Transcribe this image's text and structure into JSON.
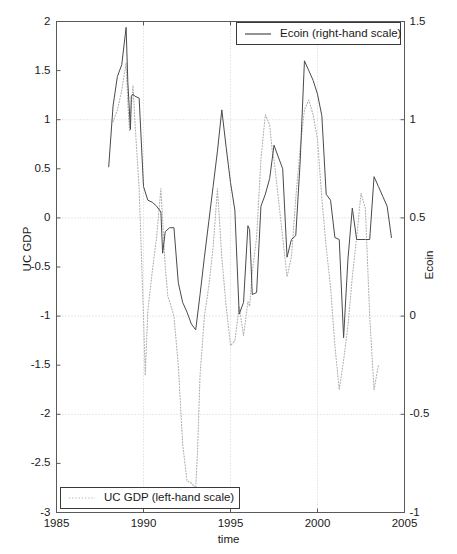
{
  "chart_data": {
    "type": "line",
    "title": "",
    "xlabel": "time",
    "ylabel": "UC GDP",
    "ylabel_right": "Ecoin",
    "grid": true,
    "xlim": [
      1985,
      2005
    ],
    "ylim_left": [
      -3,
      2
    ],
    "ylim_right": [
      -1,
      1.5
    ],
    "xticks": [
      1985,
      1990,
      1995,
      2000,
      2005
    ],
    "xticklabels": [
      "1985",
      "1990",
      "1995",
      "2000",
      "2005"
    ],
    "yticks_left": [
      2,
      1.5,
      1,
      0.5,
      0,
      -0.5,
      -1,
      -1.5,
      -2,
      -2.5,
      -3
    ],
    "yticklabels_left": [
      "2",
      "1.5",
      "1",
      "0.5",
      "0",
      "-0.5",
      "-1",
      "-1.5",
      "-2",
      "-2.5",
      "-3"
    ],
    "yticks_right": [
      1.5,
      1,
      0.5,
      0,
      -0.5,
      -1
    ],
    "yticklabels_right": [
      "1.5",
      "1",
      "0.5",
      "0",
      "-0.5",
      "-1"
    ],
    "legend_position": [
      "upper right",
      "lower left"
    ],
    "series": [
      {
        "name": "Ecoin (right-hand scale)",
        "axis": "right",
        "style": "solid",
        "color": "#4a4a4a",
        "x": [
          1988.0,
          1988.25,
          1988.5,
          1988.75,
          1989.0,
          1989.1,
          1989.25,
          1989.3,
          1989.4,
          1989.5,
          1989.75,
          1990.0,
          1990.25,
          1990.5,
          1990.75,
          1991.0,
          1991.1,
          1991.25,
          1991.5,
          1991.75,
          1992.0,
          1992.25,
          1992.5,
          1992.75,
          1993.0,
          1993.25,
          1993.5,
          1993.75,
          1994.0,
          1994.25,
          1994.5,
          1994.75,
          1995.0,
          1995.25,
          1995.5,
          1995.75,
          1996.0,
          1996.1,
          1996.25,
          1996.5,
          1996.75,
          1997.0,
          1997.25,
          1997.5,
          1997.75,
          1998.0,
          1998.25,
          1998.5,
          1998.75,
          1999.0,
          1999.25,
          1999.5,
          1999.75,
          2000.0,
          2000.25,
          2000.5,
          2000.75,
          2001.0,
          2001.25,
          2001.5,
          2001.75,
          2002.0,
          2002.25,
          2002.5,
          2002.75,
          2003.0,
          2003.25,
          2003.5,
          2003.75,
          2004.0,
          2004.25
        ],
        "y": [
          0.76,
          1.07,
          1.22,
          1.28,
          1.47,
          1.19,
          0.95,
          1.12,
          1.13,
          1.12,
          1.11,
          0.66,
          0.59,
          0.58,
          0.56,
          0.53,
          0.32,
          0.43,
          0.45,
          0.45,
          0.17,
          0.07,
          0.02,
          -0.04,
          -0.07,
          0.11,
          0.3,
          0.48,
          0.66,
          0.84,
          1.05,
          0.86,
          0.68,
          0.54,
          0.01,
          0.07,
          0.46,
          0.44,
          0.11,
          0.12,
          0.56,
          0.62,
          0.7,
          0.87,
          0.81,
          0.75,
          0.3,
          0.39,
          0.41,
          0.78,
          1.3,
          1.25,
          1.2,
          1.13,
          1.02,
          0.62,
          0.59,
          0.4,
          0.39,
          -0.11,
          0.29,
          0.55,
          0.39,
          0.39,
          0.39,
          0.39,
          0.71,
          0.66,
          0.61,
          0.56,
          0.4
        ]
      },
      {
        "name": "UC GDP (left-hand scale)",
        "axis": "left",
        "style": "dotted",
        "color": "#b0b0b0",
        "x": [
          1988.25,
          1988.5,
          1988.75,
          1989.0,
          1989.1,
          1989.2,
          1989.25,
          1989.4,
          1989.5,
          1989.75,
          1990.0,
          1990.1,
          1990.25,
          1990.5,
          1990.75,
          1991.0,
          1991.25,
          1991.4,
          1991.5,
          1991.75,
          1992.0,
          1992.25,
          1992.5,
          1992.75,
          1993.0,
          1993.1,
          1993.25,
          1993.5,
          1993.75,
          1994.0,
          1994.25,
          1994.5,
          1994.75,
          1995.0,
          1995.25,
          1995.4,
          1995.5,
          1995.75,
          1996.0,
          1996.1,
          1996.25,
          1996.5,
          1996.75,
          1997.0,
          1997.25,
          1997.4,
          1997.5,
          1997.75,
          1998.0,
          1998.25,
          1998.5,
          1998.75,
          1999.0,
          1999.25,
          1999.5,
          1999.75,
          2000.0,
          2000.25,
          2000.5,
          2000.75,
          2001.0,
          2001.25,
          2001.5,
          2001.75,
          2002.0,
          2002.25,
          2002.5,
          2002.75,
          2003.0,
          2003.25,
          2003.5
        ],
        "y": [
          0.98,
          1.1,
          1.3,
          1.58,
          1.16,
          0.88,
          1.03,
          1.35,
          1.0,
          0.3,
          -1.0,
          -1.6,
          -0.95,
          -0.55,
          -0.2,
          0.3,
          -0.5,
          -0.8,
          -0.85,
          -1.0,
          -1.5,
          -2.3,
          -2.68,
          -2.7,
          -2.75,
          -2.4,
          -1.6,
          -1.0,
          -0.7,
          -0.3,
          0.3,
          -0.4,
          -0.9,
          -1.3,
          -1.25,
          -1.05,
          -0.9,
          -1.2,
          -0.85,
          -0.9,
          -0.55,
          -0.2,
          0.6,
          1.05,
          0.95,
          0.68,
          0.6,
          0.2,
          -0.2,
          -0.6,
          -0.4,
          0.2,
          0.7,
          1.1,
          1.2,
          1.05,
          0.8,
          0.2,
          -0.3,
          -0.7,
          -1.3,
          -1.75,
          -1.45,
          -1.1,
          -0.6,
          -0.2,
          0.25,
          0.1,
          -1.0,
          -1.75,
          -1.5
        ]
      }
    ]
  },
  "legend": {
    "ecoin": {
      "label": "Ecoin (right-hand scale)",
      "marker": "solid-line"
    },
    "ucgdp": {
      "label": "UC GDP (left-hand scale)",
      "marker": "dotted-line"
    }
  },
  "colors": {
    "ecoin_line": "#4a4a4a",
    "ucgdp_line": "#b0b0b0",
    "grid": "#c8c8c8",
    "axis": "#5a5a5a",
    "text": "#1a1a1a"
  }
}
